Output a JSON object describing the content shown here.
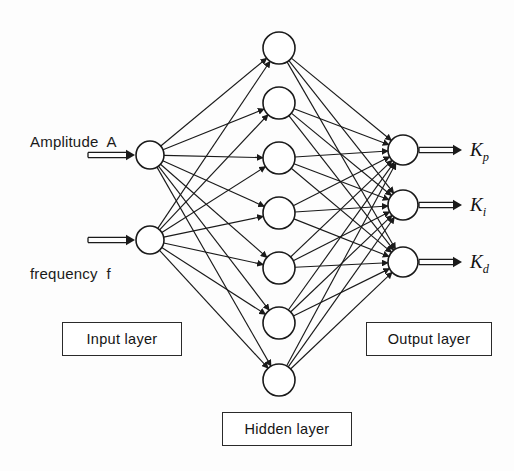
{
  "diagram": {
    "background_color": "#fdfdfd",
    "stroke_color": "#1a1a1a"
  },
  "inputs": [
    {
      "label": "Amplitude  A",
      "x": 30,
      "y": 133,
      "neuron_cx": 150,
      "neuron_cy": 155,
      "arrow_x1": 88,
      "arrow_x2": 135
    },
    {
      "label": "frequency  f",
      "x": 30,
      "y": 265,
      "neuron_cx": 150,
      "neuron_cy": 240,
      "arrow_x1": 88,
      "arrow_x2": 135
    }
  ],
  "hidden": {
    "count": 7,
    "cx": 279,
    "cys": [
      48,
      103,
      158,
      213,
      268,
      323,
      380
    ],
    "radius": 16
  },
  "outputs": [
    {
      "label": "K",
      "sub": "p",
      "cx": 403,
      "cy": 150,
      "arrow_x1": 420,
      "arrow_x2": 462,
      "label_x": 470,
      "label_y": 139
    },
    {
      "label": "K",
      "sub": "i",
      "cx": 403,
      "cy": 205,
      "arrow_x1": 420,
      "arrow_x2": 462,
      "label_x": 470,
      "label_y": 194
    },
    {
      "label": "K",
      "sub": "d",
      "cx": 403,
      "cy": 262,
      "arrow_x1": 420,
      "arrow_x2": 462,
      "label_x": 470,
      "label_y": 251
    }
  ],
  "neuron_radius": {
    "input": 14,
    "hidden": 16,
    "output": 15
  },
  "boxes": [
    {
      "name": "input-layer",
      "label": "Input layer",
      "x": 62,
      "y": 322,
      "w": 120,
      "h": 34
    },
    {
      "name": "hidden-layer",
      "label": "Hidden layer",
      "x": 222,
      "y": 412,
      "w": 130,
      "h": 34
    },
    {
      "name": "output-layer",
      "label": "Output layer",
      "x": 366,
      "y": 322,
      "w": 126,
      "h": 34
    }
  ]
}
